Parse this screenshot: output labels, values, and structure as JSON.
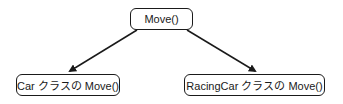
{
  "diagram": {
    "type": "tree",
    "nodes": [
      {
        "id": "root",
        "label": "Move()"
      },
      {
        "id": "car",
        "label": "Car クラスの Move()"
      },
      {
        "id": "racingcar",
        "label": "RacingCar クラスの Move()"
      }
    ],
    "edges": [
      {
        "from": "root",
        "to": "car",
        "style": "arrow"
      },
      {
        "from": "root",
        "to": "racingcar",
        "style": "arrow"
      }
    ],
    "colors": {
      "stroke": "#1a1a1a",
      "background": "#ffffff",
      "text": "#1a1a1a"
    }
  }
}
